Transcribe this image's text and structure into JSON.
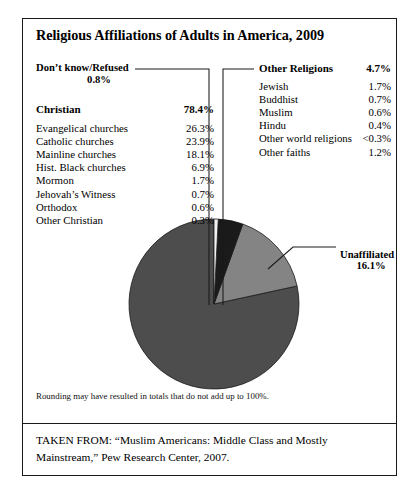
{
  "figure": {
    "title": "Religious Affiliations of Adults in America, 2009",
    "footnote": "Rounding may have resulted in totals that do not add up to 100%.",
    "source": "TAKEN FROM: “Muslim Americans: Middle Class and Mostly Mainstream,” Pew Research Center, 2007."
  },
  "callouts": {
    "dont_know": {
      "label": "Don’t know/Refused",
      "value": "0.8%"
    },
    "unaffiliated": {
      "label": "Unaffiliated",
      "value": "16.1%"
    }
  },
  "christian_group": {
    "header": {
      "label": "Christian",
      "value": "78.4%"
    },
    "rows": [
      {
        "label": "Evangelical churches",
        "value": "26.3%"
      },
      {
        "label": "Catholic churches",
        "value": "23.9%"
      },
      {
        "label": "Mainline churches",
        "value": "18.1%"
      },
      {
        "label": "Hist. Black churches",
        "value": "6.9%"
      },
      {
        "label": "Mormon",
        "value": "1.7%"
      },
      {
        "label": "Jehovah’s Witness",
        "value": "0.7%"
      },
      {
        "label": "Orthodox",
        "value": "0.6%"
      },
      {
        "label": "Other Christian",
        "value": "0.3%"
      }
    ]
  },
  "other_religions_group": {
    "header": {
      "label": "Other Religions",
      "value": "4.7%"
    },
    "rows": [
      {
        "label": "Jewish",
        "value": "1.7%"
      },
      {
        "label": "Buddhist",
        "value": "0.7%"
      },
      {
        "label": "Muslim",
        "value": "0.6%"
      },
      {
        "label": "Hindu",
        "value": "0.4%"
      },
      {
        "label": "Other world religions",
        "value": "<0.3%"
      },
      {
        "label": "Other faiths",
        "value": "1.2%"
      }
    ]
  },
  "chart_data": {
    "type": "pie",
    "title": "Religious Affiliations of Adults in America, 2009",
    "labels": [
      "Christian",
      "Unaffiliated",
      "Other Religions",
      "Don’t know/Refused"
    ],
    "values": [
      78.4,
      16.1,
      4.7,
      0.8
    ],
    "colors": [
      "#4d4d4d",
      "#848484",
      "#1a1a1a",
      "#f2f2f2"
    ],
    "legend": "callout-labels",
    "grid": false,
    "center": [
      213,
      303
    ],
    "radius": 85,
    "start_angle_deg": -90,
    "direction": "counterclockwise"
  },
  "colors": {
    "border": "#1a1a1a",
    "christian_slice": "#4d4d4d",
    "unaffiliated_slice": "#848484",
    "other_religions_slice": "#1a1a1a",
    "dont_know_slice": "#f2f2f2",
    "text": "#000000"
  }
}
